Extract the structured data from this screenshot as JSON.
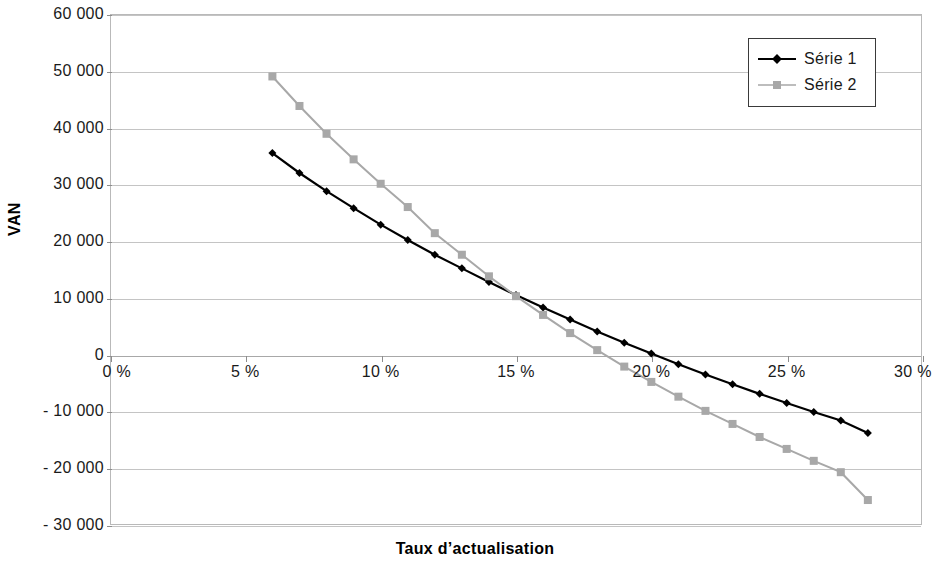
{
  "chart_data": {
    "type": "line",
    "title": "",
    "xlabel": "Taux d’actualisation",
    "ylabel": "VAN",
    "xlim": [
      0,
      30
    ],
    "ylim": [
      -30000,
      60000
    ],
    "grid": true,
    "legend_position": "top-right",
    "x_tick_labels": [
      "0 %",
      "5 %",
      "10 %",
      "15 %",
      "20 %",
      "25 %",
      "30 %"
    ],
    "x_ticks": [
      0,
      5,
      10,
      15,
      20,
      25,
      30
    ],
    "y_tick_labels": [
      "60 000",
      "50 000",
      "40 000",
      "30 000",
      "20 000",
      "10 000",
      "0",
      "- 10 000",
      "- 20 000",
      "- 30 000"
    ],
    "y_ticks": [
      60000,
      50000,
      40000,
      30000,
      20000,
      10000,
      0,
      -10000,
      -20000,
      -30000
    ],
    "x": [
      6,
      7,
      8,
      9,
      10,
      11,
      12,
      13,
      14,
      15,
      16,
      17,
      18,
      19,
      20,
      21,
      22,
      23,
      24,
      25,
      26,
      27,
      28
    ],
    "series": [
      {
        "name": "Série 1",
        "color": "#000000",
        "marker": "diamond",
        "values": [
          35500,
          32000,
          28800,
          25800,
          22900,
          20200,
          17600,
          15200,
          12800,
          10500,
          8300,
          6200,
          4100,
          2100,
          200,
          -1700,
          -3500,
          -5200,
          -6900,
          -8500,
          -10100,
          -11600,
          -13800
        ]
      },
      {
        "name": "Série 2",
        "color": "#a8a8a8",
        "marker": "square",
        "values": [
          49000,
          43800,
          38900,
          34400,
          30100,
          26000,
          21400,
          17600,
          13800,
          10300,
          7000,
          3800,
          800,
          -2100,
          -4800,
          -7400,
          -9900,
          -12200,
          -14500,
          -16600,
          -18700,
          -20700,
          -25600
        ]
      }
    ]
  },
  "legend": {
    "entries": [
      {
        "label": "Série 1"
      },
      {
        "label": "Série 2"
      }
    ]
  }
}
